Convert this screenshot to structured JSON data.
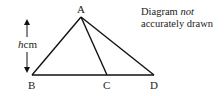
{
  "diagram": {
    "vertices": {
      "A": {
        "label": "A",
        "x": 81,
        "y": 17
      },
      "B": {
        "label": "B",
        "x": 32,
        "y": 75
      },
      "C": {
        "label": "C",
        "x": 107,
        "y": 75
      },
      "D": {
        "label": "D",
        "x": 154,
        "y": 75
      }
    },
    "height_label": {
      "var": "h",
      "unit": "cm"
    },
    "note_line1_prefix": "Diagram ",
    "note_line1_emph": "not",
    "note_line2": "accurately drawn",
    "stroke_color": "#111111"
  }
}
